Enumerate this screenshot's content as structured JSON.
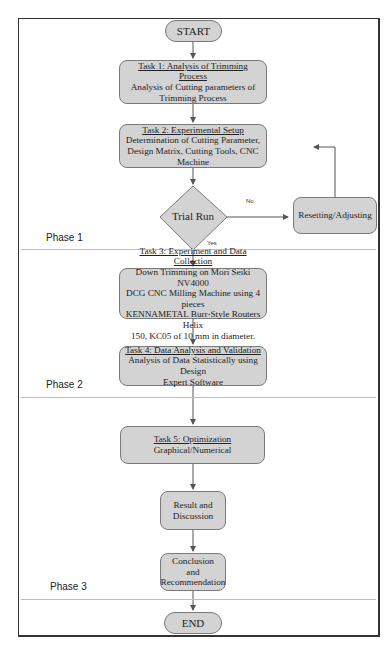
{
  "flowchart": {
    "start": "START",
    "end": "END",
    "tasks": [
      {
        "title": "Task 1: Analysis of Trimming Process",
        "body": [
          "Analysis of Cutting parameters of",
          "Trimming Process"
        ]
      },
      {
        "title": "Task 2: Experimental Setup",
        "body": [
          "Determination of Cutting Parameter,",
          "Design Matrix, Cutting Tools, CNC",
          "Machine"
        ]
      },
      {
        "title": "Task 3: Experiment and Data Collection",
        "body": [
          "Down Trimming on Mori Seiki NV4000",
          "DCG CNC Milling Machine using 4 pieces",
          "KENNAMETAL Burr-Style Routers Helix",
          "150, KC05 of 10 mm in diameter."
        ]
      },
      {
        "title": "Task 4: Data Analysis and Validation",
        "body": [
          "Analysis of Data Statistically using Design",
          "Expert Software"
        ]
      },
      {
        "title": "Task 5: Optimization",
        "body": [
          "Graphical/Numerical"
        ]
      }
    ],
    "decision": "Trial Run",
    "decision_no": "No",
    "decision_yes": "Yes",
    "loop_node": "Resetting/Adjusting",
    "result_node": [
      "Result and",
      "Discussion"
    ],
    "conclusion_node": [
      "Conclusion and",
      "Recommendation"
    ],
    "phases": [
      "Phase 1",
      "Phase 2",
      "Phase 3"
    ]
  },
  "colors": {
    "node_fill": "#d3d3d3",
    "node_border": "#7a7a7a",
    "line": "#555555"
  }
}
